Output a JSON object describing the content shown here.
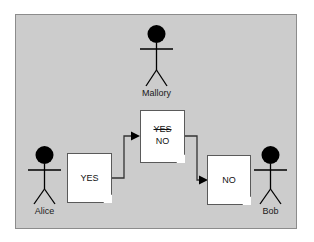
{
  "diagram": {
    "panel": {
      "background_color": "#cccccc",
      "border_color": "#8c8c8c"
    },
    "actors": [
      {
        "id": "mallory",
        "label": "Mallory",
        "position": "top-center"
      },
      {
        "id": "alice",
        "label": "Alice",
        "position": "bottom-left"
      },
      {
        "id": "bob",
        "label": "Bob",
        "position": "bottom-right"
      }
    ],
    "documents": [
      {
        "id": "alice-message",
        "lines": [
          {
            "text": "YES",
            "strikethrough": false
          }
        ]
      },
      {
        "id": "tampered-message",
        "lines": [
          {
            "text": "YES",
            "strikethrough": true
          },
          {
            "text": "NO",
            "strikethrough": false
          }
        ]
      },
      {
        "id": "bob-message",
        "lines": [
          {
            "text": "NO",
            "strikethrough": false
          }
        ]
      }
    ],
    "connectors": [
      {
        "id": "alice-to-tampered",
        "from": "alice-message",
        "to": "tampered-message",
        "arrowhead": "filled-triangle"
      },
      {
        "id": "tampered-to-bob",
        "from": "tampered-message",
        "to": "bob-message",
        "arrowhead": "filled-triangle"
      }
    ],
    "text": {
      "alice_doc_yes": "YES",
      "tampered_doc_yes": "YES",
      "tampered_doc_no": "NO",
      "bob_doc_no": "NO",
      "alice_name": "Alice",
      "bob_name": "Bob",
      "mallory_name": "Mallory"
    },
    "colors": {
      "line": "#333333",
      "document_fill": "#ffffff",
      "document_border": "#5a5a5a",
      "text": "#111111"
    }
  }
}
